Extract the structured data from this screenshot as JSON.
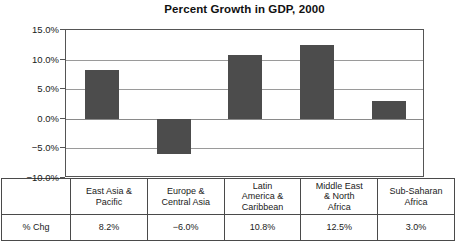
{
  "chart_data": {
    "type": "bar",
    "title": "Percent Growth in GDP, 2000",
    "xlabel": "",
    "ylabel": "",
    "ylim": [
      -10.0,
      15.0
    ],
    "grid": true,
    "legend": "none",
    "bar_color": "#4c4c4c",
    "categories": [
      "East Asia & Pacific",
      "Europe & Central Asia",
      "Latin America & Caribbean",
      "Middle East & North Africa",
      "Sub-Saharan Africa"
    ],
    "values": [
      8.2,
      -6.0,
      10.8,
      12.5,
      3.0
    ],
    "value_labels": [
      "8.2%",
      "−6.0%",
      "10.8%",
      "12.5%",
      "3.0%"
    ],
    "ytick_labels": [
      "15.0%",
      "10.0%",
      "5.0%",
      "0.0%",
      "−5.0%",
      "−10.0%"
    ],
    "ytick_values": [
      15.0,
      10.0,
      5.0,
      0.0,
      -5.0,
      -10.0
    ]
  },
  "table": {
    "row_label": "% Chg",
    "category_lines": [
      [
        "East Asia &",
        "Pacific"
      ],
      [
        "Europe &",
        "Central Asia"
      ],
      [
        "Latin",
        "America &",
        "Caribbean"
      ],
      [
        "Middle East",
        "& North",
        "Africa"
      ],
      [
        "Sub-Saharan",
        "Africa"
      ]
    ]
  }
}
